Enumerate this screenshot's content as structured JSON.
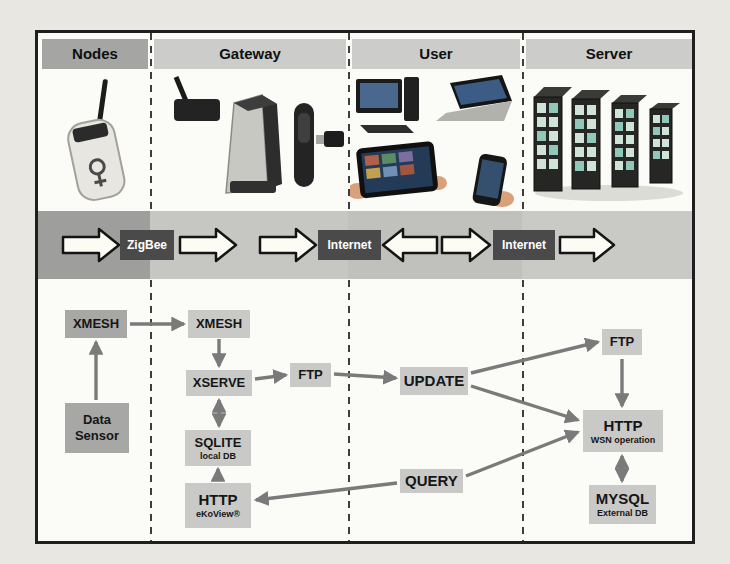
{
  "figure": {
    "columns": [
      {
        "id": "nodes",
        "label": "Nodes"
      },
      {
        "id": "gateway",
        "label": "Gateway"
      },
      {
        "id": "user",
        "label": "User"
      },
      {
        "id": "server",
        "label": "Server"
      }
    ],
    "devices": {
      "nodes": [
        "sensor-mote"
      ],
      "gateway": [
        "wireless-router",
        "gateway-tower",
        "handheld-receiver",
        "usb-dongle"
      ],
      "user": [
        "desktop-computer",
        "laptop",
        "tablet-in-hands",
        "smartphone"
      ],
      "server": [
        "server-racks"
      ]
    },
    "band": {
      "labels": [
        "ZigBee",
        "Internet",
        "Internet"
      ],
      "sequence": [
        "arrow-right",
        "ZigBee",
        "arrow-right",
        "arrow-right",
        "Internet",
        "arrow-left",
        "arrow-right",
        "Internet",
        "arrow-right"
      ],
      "label_bg": "#4a4a4a",
      "label_color": "#ffffff",
      "arrow_fill": "#fcfcf4",
      "arrow_stroke": "#141414"
    },
    "flow": {
      "boxes": [
        {
          "id": "xmesh-nodes",
          "label": "XMESH",
          "sublabel": ""
        },
        {
          "id": "data-sensor",
          "label": "Data Sensor",
          "sublabel": ""
        },
        {
          "id": "xmesh-gateway",
          "label": "XMESH",
          "sublabel": ""
        },
        {
          "id": "xserve",
          "label": "XSERVE",
          "sublabel": ""
        },
        {
          "id": "ftp-gateway",
          "label": "FTP",
          "sublabel": ""
        },
        {
          "id": "sqlite",
          "label": "SQLITE",
          "sublabel": "local DB"
        },
        {
          "id": "http-gateway",
          "label": "HTTP",
          "sublabel": "eKoView®"
        },
        {
          "id": "update",
          "label": "UPDATE",
          "sublabel": ""
        },
        {
          "id": "query",
          "label": "QUERY",
          "sublabel": ""
        },
        {
          "id": "ftp-server",
          "label": "FTP",
          "sublabel": ""
        },
        {
          "id": "http-server",
          "label": "HTTP",
          "sublabel": "WSN operation"
        },
        {
          "id": "mysql",
          "label": "MYSQL",
          "sublabel": "External DB"
        }
      ],
      "connections": [
        {
          "from": "data-sensor",
          "to": "xmesh-nodes",
          "double": false
        },
        {
          "from": "xmesh-nodes",
          "to": "xmesh-gateway",
          "double": false
        },
        {
          "from": "xmesh-gateway",
          "to": "xserve",
          "double": false
        },
        {
          "from": "xserve",
          "to": "sqlite",
          "double": true
        },
        {
          "from": "http-gateway",
          "to": "sqlite",
          "double": false
        },
        {
          "from": "xserve",
          "to": "ftp-gateway",
          "double": false
        },
        {
          "from": "ftp-gateway",
          "to": "update",
          "double": false
        },
        {
          "from": "update",
          "to": "ftp-server",
          "double": false
        },
        {
          "from": "update",
          "to": "http-server",
          "double": false
        },
        {
          "from": "query",
          "to": "http-server",
          "double": false
        },
        {
          "from": "query",
          "to": "http-gateway",
          "double": false
        },
        {
          "from": "ftp-server",
          "to": "http-server",
          "double": false
        },
        {
          "from": "http-server",
          "to": "mysql",
          "double": true
        }
      ],
      "arrow_color": "#7a7a7a"
    },
    "colors": {
      "page_background": "#e9e7e1",
      "figure_background": "#fbfbf8",
      "border": "#1f1f1f",
      "header_dark": "#a5a5a3",
      "header_light": "#ccccca",
      "box_dark": "#a7a7a5",
      "box_light": "#c9c9c7",
      "band_nodes": "#9e9e9c",
      "band_gateway": "#c6c6c3",
      "band_user": "#c0c0bd",
      "band_server": "#c9c9c6"
    }
  }
}
